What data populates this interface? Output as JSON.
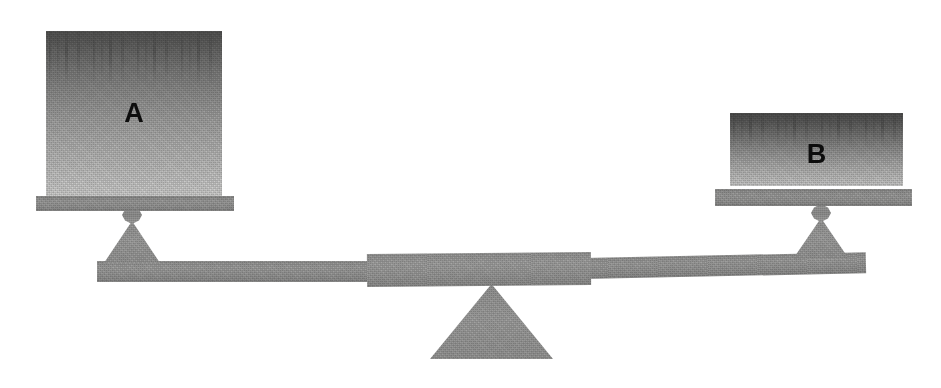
{
  "scene": {
    "title": "Balance scale with two weights",
    "width": 941,
    "height": 388,
    "background_color": "#ffffff"
  },
  "colors": {
    "block_top": "#555554",
    "block_bottom": "#d4d4d3",
    "hardware": "#9d9d9c",
    "beam": "#9b9b9a",
    "label_text": "#0d0d0d"
  },
  "blocks": [
    {
      "id": "block-a",
      "label": "A",
      "x": 46,
      "y": 31,
      "width": 176,
      "height": 165,
      "label_x": 133,
      "label_y": 100,
      "font_size": 27
    },
    {
      "id": "block-b",
      "label": "B",
      "x": 730,
      "y": 113,
      "width": 173,
      "height": 72,
      "label_x": 820,
      "label_y": 141,
      "font_size": 27
    }
  ],
  "pans": [
    {
      "id": "pan-left",
      "x": 36,
      "y": 196,
      "width": 198,
      "height": 15
    },
    {
      "id": "pan-right",
      "x": 715,
      "y": 189,
      "width": 197,
      "height": 18
    }
  ],
  "knobs": [
    {
      "id": "knob-left",
      "x": 122,
      "y": 207,
      "width": 19,
      "height": 17
    },
    {
      "id": "knob-right",
      "x": 811,
      "y": 205,
      "width": 19,
      "height": 17
    }
  ],
  "supports": [
    {
      "id": "support-left",
      "x": 104,
      "y": 221,
      "width": 56,
      "height": 42
    },
    {
      "id": "support-right",
      "x": 793,
      "y": 218,
      "width": 56,
      "height": 40
    }
  ],
  "beam": {
    "left_arm": {
      "x": 97,
      "y": 261,
      "width": 272,
      "height": 21,
      "tilt_deg": 0.0
    },
    "right_arm": {
      "x": 589,
      "y": 255,
      "width": 277,
      "height": 21,
      "tilt_deg": -1.2
    },
    "center": {
      "x": 367,
      "y": 252,
      "width": 224,
      "height": 34
    }
  },
  "fulcrum": {
    "id": "fulcrum-triangle",
    "apex_x": 478,
    "apex_y": 284,
    "base_left_x": 430,
    "base_right_x": 553,
    "base_y": 358,
    "width": 123,
    "height": 74
  },
  "state": {
    "tilt_description": "left side down",
    "heavier_side": "A"
  }
}
